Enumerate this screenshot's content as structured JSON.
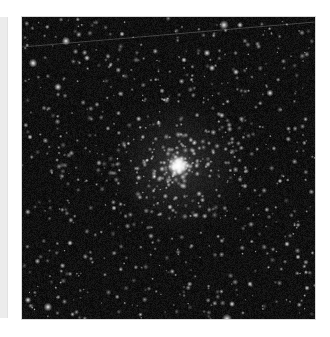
{
  "page": {
    "background": "#ffffff",
    "side_strip_color": "#ececec"
  },
  "image": {
    "alt": "Globular star cluster on a dark sky background with a faint satellite trail",
    "subject": "globular star cluster",
    "background_color": "#070707",
    "width": 293,
    "height": 302,
    "cluster_center": {
      "x": 156,
      "y": 149
    },
    "cluster_core_radius": 10,
    "cluster_halo_radius": 70,
    "satellite_trail": {
      "x1": 0,
      "y1": 30,
      "x2": 293,
      "y2": 5,
      "color": "rgba(200,200,200,0.35)"
    },
    "bright_stars": [
      {
        "x": 202,
        "y": 8,
        "r": 2.2
      },
      {
        "x": 44,
        "y": 24,
        "r": 2.0
      },
      {
        "x": 218,
        "y": 8,
        "r": 1.4
      },
      {
        "x": 11,
        "y": 46,
        "r": 2.0
      },
      {
        "x": 65,
        "y": 41,
        "r": 1.4
      },
      {
        "x": 190,
        "y": 51,
        "r": 1.5
      },
      {
        "x": 248,
        "y": 76,
        "r": 1.6
      },
      {
        "x": 36,
        "y": 70,
        "r": 1.8
      },
      {
        "x": 185,
        "y": 36,
        "r": 1.6
      },
      {
        "x": 162,
        "y": 43,
        "r": 1.3
      },
      {
        "x": 214,
        "y": 55,
        "r": 1.4
      },
      {
        "x": 8,
        "y": 120,
        "r": 1.2
      },
      {
        "x": 6,
        "y": 283,
        "r": 1.5
      },
      {
        "x": 26,
        "y": 290,
        "r": 2.0
      },
      {
        "x": 48,
        "y": 226,
        "r": 1.3
      },
      {
        "x": 92,
        "y": 191,
        "r": 1.2
      },
      {
        "x": 205,
        "y": 302,
        "r": 2.4
      },
      {
        "x": 210,
        "y": 287,
        "r": 1.4
      },
      {
        "x": 265,
        "y": 227,
        "r": 1.3
      },
      {
        "x": 276,
        "y": 240,
        "r": 1.2
      },
      {
        "x": 148,
        "y": 190,
        "r": 1.3
      },
      {
        "x": 228,
        "y": 267,
        "r": 1.3
      },
      {
        "x": 258,
        "y": 164,
        "r": 1.1
      },
      {
        "x": 285,
        "y": 271,
        "r": 1.2
      },
      {
        "x": 100,
        "y": 17,
        "r": 1.2
      }
    ],
    "random_star_count": 650,
    "cluster_star_count": 260,
    "seed": 20240
  }
}
